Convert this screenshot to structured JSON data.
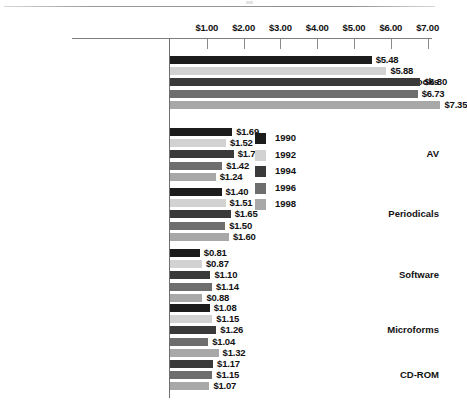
{
  "page": {
    "background": "#ffffff",
    "scan_rule_visible": true
  },
  "chart_data": {
    "type": "bar",
    "orientation": "horizontal",
    "title": "",
    "subtitle": "",
    "xlabel": "",
    "ylabel": "",
    "xlim": [
      0,
      7.6
    ],
    "grid": false,
    "legend_position": "inside-upper-center",
    "tick_labels": [
      "$1.00",
      "$2.00",
      "$3.00",
      "$4.00",
      "$5.00",
      "$6.00",
      "$7.00"
    ],
    "tick_values": [
      1,
      2,
      3,
      4,
      5,
      6,
      7
    ],
    "categories": [
      "Books",
      "AV",
      "Periodicals",
      "Software",
      "Microforms",
      "CD-ROM"
    ],
    "series": [
      {
        "name": "1990",
        "color": "#1c1c1c",
        "values": [
          5.48,
          1.69,
          1.4,
          0.81,
          1.08,
          null
        ],
        "labels": [
          "$5.48",
          "$1.69",
          "$1.40",
          "$0.81",
          "$1.08",
          null
        ]
      },
      {
        "name": "1992",
        "color": "#d2d2d2",
        "values": [
          5.88,
          1.52,
          1.51,
          0.87,
          1.15,
          null
        ],
        "labels": [
          "$5.88",
          "$1.52",
          "$1.51",
          "$0.87",
          "$1.15",
          null
        ]
      },
      {
        "name": "1994",
        "color": "#3a3a3a",
        "values": [
          6.8,
          1.73,
          1.65,
          1.1,
          1.26,
          1.17
        ],
        "labels": [
          "$6.80",
          "$1.73",
          "$1.65",
          "$1.10",
          "$1.26",
          "$1.17"
        ]
      },
      {
        "name": "1996",
        "color": "#6e6e6e",
        "values": [
          6.73,
          1.42,
          1.5,
          1.14,
          1.04,
          1.15
        ],
        "labels": [
          "$6.73",
          "$1.42",
          "$1.50",
          "$1.14",
          "$1.04",
          "$1.15"
        ]
      },
      {
        "name": "1998",
        "color": "#a8a8a8",
        "values": [
          7.35,
          1.24,
          1.6,
          0.88,
          1.32,
          1.07
        ],
        "labels": [
          "$7.35",
          "$1.24",
          "$1.60",
          "$0.88",
          "$1.32",
          "$1.07"
        ]
      }
    ]
  },
  "legend": {
    "entries": [
      {
        "label": "1990",
        "color": "#1c1c1c"
      },
      {
        "label": "1992",
        "color": "#d2d2d2"
      },
      {
        "label": "1994",
        "color": "#3a3a3a"
      },
      {
        "label": "1996",
        "color": "#6e6e6e"
      },
      {
        "label": "1998",
        "color": "#a8a8a8"
      }
    ]
  }
}
